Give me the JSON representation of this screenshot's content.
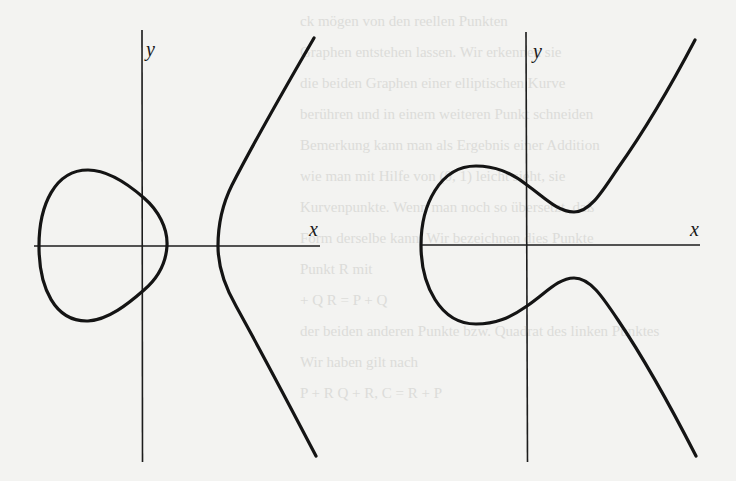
{
  "figure": {
    "colors": {
      "paper": "#f3f3f1",
      "ink": "#141414",
      "bleed_text": "#d9d9d6"
    },
    "left_plot": {
      "x_axis_label": "x",
      "y_axis_label": "y",
      "components": [
        "bounded oval crossing both axes",
        "unbounded branch opening to the right"
      ]
    },
    "right_plot": {
      "x_axis_label": "x",
      "y_axis_label": "y",
      "components": [
        "single connected unbounded curve with a bulge to the left"
      ]
    }
  },
  "bleed_through_text": [
    "ck mögen von den reellen Punkten",
    "Graphen entstehen lassen. Wir erkennen sie",
    "die beiden Graphen einer elliptischen Kurve",
    "berühren und in einem weiteren Punkt schneiden",
    "Bemerkung kann man als Ergebnis einer Addition",
    "wie man mit Hilfe von (0, 1) leicht sieht, sie",
    "Kurvenpunkte. Wenn man noch so übersetzt, daß",
    "Form derselbe kann. Wir bezeichnen dies Punkte",
    "Punkt R mit",
    "+ Q    R = P + Q",
    "der beiden anderen Punkte bzw. Quadrat des linken Punktes",
    "Wir haben gilt nach",
    "P + R        Q + R,  C = R + P"
  ]
}
